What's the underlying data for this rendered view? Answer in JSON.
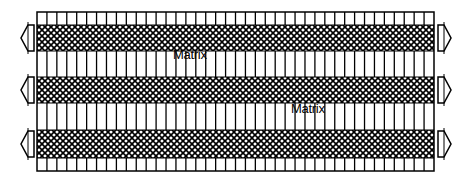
{
  "diagram": {
    "type": "laminate-cross-section",
    "box": {
      "x": 37,
      "y": 12,
      "width": 397,
      "height": 159
    },
    "stroke_color": "#000000",
    "background_color": "#ffffff",
    "column_count": 40,
    "bands": [
      {
        "kind": "stripes",
        "y0": 12,
        "y1": 25
      },
      {
        "kind": "hatch",
        "y0": 25,
        "y1": 51
      },
      {
        "kind": "stripes",
        "y0": 51,
        "y1": 77
      },
      {
        "kind": "hatch",
        "y0": 77,
        "y1": 103
      },
      {
        "kind": "stripes",
        "y0": 103,
        "y1": 130
      },
      {
        "kind": "hatch",
        "y0": 130,
        "y1": 158
      },
      {
        "kind": "stripes",
        "y0": 158,
        "y1": 171
      }
    ],
    "arrows": {
      "left": [
        {
          "cy": 38
        },
        {
          "cy": 90
        },
        {
          "cy": 144
        }
      ],
      "right": [
        {
          "cy": 38
        },
        {
          "cy": 90
        },
        {
          "cy": 144
        }
      ]
    },
    "labels": [
      {
        "text": "Matrix",
        "x": 173,
        "y": 54
      },
      {
        "text": "Matrix",
        "x": 291,
        "y": 108
      }
    ]
  }
}
